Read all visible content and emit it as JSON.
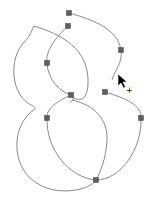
{
  "canvas": {
    "width": 154,
    "height": 203,
    "background": "#ffffff",
    "stroke_color": "#8a8a8a",
    "anchor_color": "#5f5f5f"
  },
  "shape": {
    "description": "figure-8 vector path with editable anchor points",
    "anchors": [
      {
        "x": 69,
        "y": 13
      },
      {
        "x": 68,
        "y": 26
      },
      {
        "x": 47,
        "y": 63
      },
      {
        "x": 71,
        "y": 95
      },
      {
        "x": 121,
        "y": 50
      },
      {
        "x": 105,
        "y": 92
      },
      {
        "x": 47,
        "y": 118
      },
      {
        "x": 141,
        "y": 118
      },
      {
        "x": 96,
        "y": 180
      }
    ]
  },
  "cursor": {
    "icon": "pen-add-anchor-cursor",
    "x": 118,
    "y": 74,
    "modifier": "+"
  }
}
